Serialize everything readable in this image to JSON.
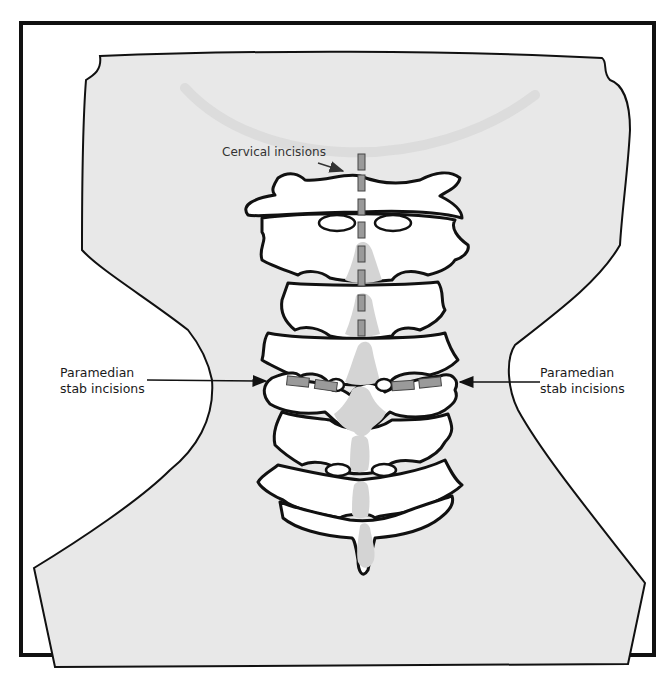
{
  "figure": {
    "type": "anatomical-illustration",
    "colors": {
      "frame": "#111111",
      "neck_fill": "#e8e8e8",
      "vertebra_fill": "#ffffff",
      "outline": "#111111",
      "spinous_process": "#d4d4d4",
      "incision": "#9a9a9a",
      "background": "#ffffff"
    }
  },
  "labels": {
    "cervical": "Cervical incisions",
    "paramedian_left_line1": "Paramedian",
    "paramedian_left_line2": "stab incisions",
    "paramedian_right_line1": "Paramedian",
    "paramedian_right_line2": "stab incisions"
  },
  "incisions": {
    "cervical_count": 8,
    "paramedian_left_count": 2,
    "paramedian_right_count": 2
  }
}
